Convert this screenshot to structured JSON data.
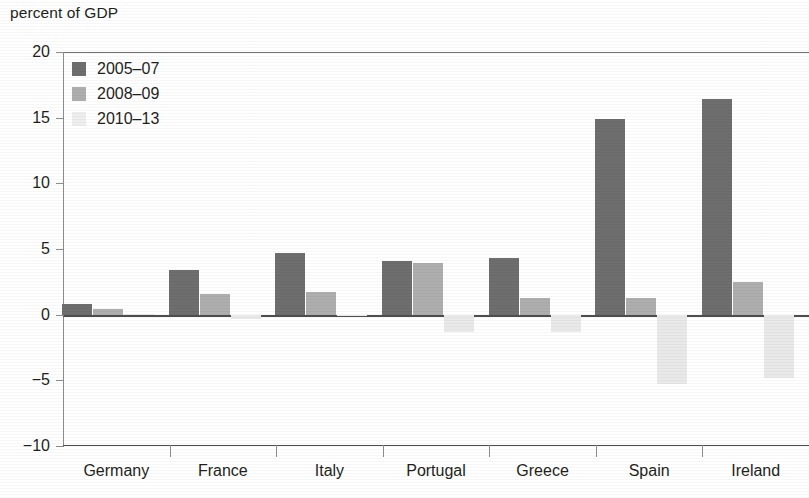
{
  "chart_data": {
    "type": "bar",
    "title": "percent of GDP",
    "xlabel": "",
    "ylabel": "percent of GDP",
    "ylim": [
      -10,
      20
    ],
    "yticks": [
      20,
      15,
      10,
      5,
      0,
      -5,
      -10
    ],
    "ytick_labels": [
      "20",
      "15",
      "10",
      "5",
      "0",
      "−5",
      "−10"
    ],
    "grid": false,
    "legend_position": "top-left",
    "categories": [
      "Germany",
      "France",
      "Italy",
      "Portugal",
      "Greece",
      "Spain",
      "Ireland"
    ],
    "series": [
      {
        "name": "2005–07",
        "color": "#6e6e6e",
        "values": [
          0.8,
          3.4,
          4.7,
          4.1,
          4.3,
          14.9,
          16.4
        ]
      },
      {
        "name": "2008–09",
        "color": "#aeaeae",
        "values": [
          0.4,
          1.6,
          1.7,
          3.9,
          1.3,
          1.3,
          2.5
        ]
      },
      {
        "name": "2010–13",
        "color": "#e9e9e9",
        "values": [
          0.05,
          -0.3,
          -0.1,
          -1.3,
          -1.3,
          -5.3,
          -4.8
        ]
      }
    ]
  },
  "colors": {
    "series_2005_07": "#6e6e6e",
    "series_2008_09": "#aeaeae",
    "series_2010_13": "#e9e9e9",
    "axis": "#8d8d8d",
    "text": "#231f20",
    "background": "#ffffff"
  }
}
